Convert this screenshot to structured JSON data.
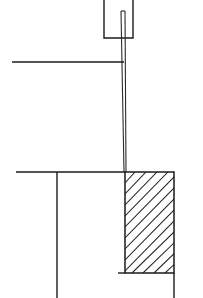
{
  "drawing": {
    "title": "Technical cross-section line drawing",
    "description": "Monochrome engineering cross-section: an open-top U-shaped bracket at top center, a long slender double-line vertical member descending from it, two horizontal reference lines extending to the left, a vertical member dropping from the lower horizontal line, and a cross-hatched solid block at lower right.",
    "background_color": "#ffffff",
    "line_color": "#1a1a1a",
    "canvas": {
      "width": 203,
      "height": 298
    },
    "elements": [
      {
        "name": "top-bracket",
        "label": "U-shaped open-top bracket",
        "type": "polyline",
        "points": "104,0 104,38 133,38 133,0"
      },
      {
        "name": "vertical-shaft-left-edge",
        "label": "Slender vertical shaft, left edge",
        "type": "line",
        "x1": 121,
        "y1": 11,
        "x2": 124,
        "y2": 172
      },
      {
        "name": "vertical-shaft-right-edge",
        "label": "Slender vertical shaft, right edge",
        "type": "line",
        "x1": 125,
        "y1": 11,
        "x2": 126,
        "y2": 172
      },
      {
        "name": "vertical-shaft-cap",
        "label": "Top cap of slender vertical shaft",
        "type": "line",
        "x1": 121,
        "y1": 11,
        "x2": 125,
        "y2": 11
      },
      {
        "name": "upper-horizontal-datum",
        "label": "Upper horizontal reference line",
        "type": "line",
        "x1": 12,
        "y1": 62,
        "x2": 124,
        "y2": 62
      },
      {
        "name": "lower-horizontal-datum",
        "label": "Lower horizontal reference line",
        "type": "line",
        "x1": 16,
        "y1": 172,
        "x2": 125,
        "y2": 172
      },
      {
        "name": "lower-vertical-member",
        "label": "Vertical member dropping from lower datum",
        "type": "line",
        "x1": 57,
        "y1": 172,
        "x2": 57,
        "y2": 298
      },
      {
        "name": "hatched-block",
        "label": "Cross-hatched solid block",
        "type": "rect",
        "x": 125,
        "y": 172,
        "width": 49,
        "height": 101,
        "hatch_angle_deg": 45,
        "hatch_spacing_px": 11
      },
      {
        "name": "block-right-extension",
        "label": "Vertical edge continuing below hatched block",
        "type": "line",
        "x1": 174,
        "y1": 273,
        "x2": 174,
        "y2": 298
      },
      {
        "name": "block-bottom-extension",
        "label": "Short horizontal stub at block bottom left",
        "type": "line",
        "x1": 118,
        "y1": 273,
        "x2": 125,
        "y2": 273
      }
    ],
    "hatch_lines": [
      "125,216 168,172",
      "125,227 179,172",
      "125,238 179,183",
      "125,249 179,194",
      "125,260 179,205",
      "125,271 179,216",
      "132,273 179,227",
      "143,273 179,238",
      "154,273 179,249",
      "165,273 179,260",
      "125,205 157,172",
      "125,194 146,172",
      "125,183 135,172"
    ]
  }
}
